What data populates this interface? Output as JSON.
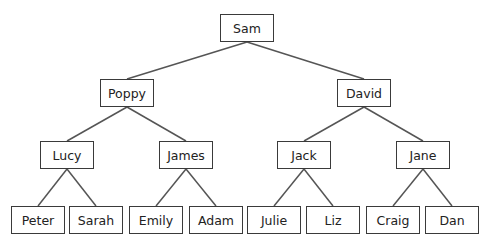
{
  "diagram": {
    "type": "tree",
    "line_color": "#555555",
    "border_color": "#3a3a3a",
    "nodes": [
      {
        "id": "sam",
        "label": "Sam",
        "x": 220,
        "y": 14,
        "w": 54,
        "h": 28
      },
      {
        "id": "poppy",
        "label": "Poppy",
        "x": 100,
        "y": 79,
        "w": 54,
        "h": 28
      },
      {
        "id": "david",
        "label": "David",
        "x": 337,
        "y": 79,
        "w": 54,
        "h": 28
      },
      {
        "id": "lucy",
        "label": "Lucy",
        "x": 40,
        "y": 141,
        "w": 54,
        "h": 28
      },
      {
        "id": "james",
        "label": "James",
        "x": 159,
        "y": 141,
        "w": 54,
        "h": 28
      },
      {
        "id": "jack",
        "label": "Jack",
        "x": 277,
        "y": 141,
        "w": 54,
        "h": 28
      },
      {
        "id": "jane",
        "label": "Jane",
        "x": 396,
        "y": 141,
        "w": 54,
        "h": 28
      },
      {
        "id": "peter",
        "label": "Peter",
        "x": 11,
        "y": 206,
        "w": 54,
        "h": 28
      },
      {
        "id": "sarah",
        "label": "Sarah",
        "x": 69,
        "y": 206,
        "w": 54,
        "h": 28
      },
      {
        "id": "emily",
        "label": "Emily",
        "x": 129,
        "y": 206,
        "w": 54,
        "h": 28
      },
      {
        "id": "adam",
        "label": "Adam",
        "x": 189,
        "y": 206,
        "w": 54,
        "h": 28
      },
      {
        "id": "julie",
        "label": "Julie",
        "x": 247,
        "y": 206,
        "w": 54,
        "h": 28
      },
      {
        "id": "liz",
        "label": "Liz",
        "x": 306,
        "y": 206,
        "w": 54,
        "h": 28
      },
      {
        "id": "craig",
        "label": "Craig",
        "x": 366,
        "y": 206,
        "w": 54,
        "h": 28
      },
      {
        "id": "dan",
        "label": "Dan",
        "x": 425,
        "y": 206,
        "w": 54,
        "h": 28
      }
    ],
    "edges": [
      [
        "sam",
        "poppy"
      ],
      [
        "sam",
        "david"
      ],
      [
        "poppy",
        "lucy"
      ],
      [
        "poppy",
        "james"
      ],
      [
        "david",
        "jack"
      ],
      [
        "david",
        "jane"
      ],
      [
        "lucy",
        "peter"
      ],
      [
        "lucy",
        "sarah"
      ],
      [
        "james",
        "emily"
      ],
      [
        "james",
        "adam"
      ],
      [
        "jack",
        "julie"
      ],
      [
        "jack",
        "liz"
      ],
      [
        "jane",
        "craig"
      ],
      [
        "jane",
        "dan"
      ]
    ]
  }
}
